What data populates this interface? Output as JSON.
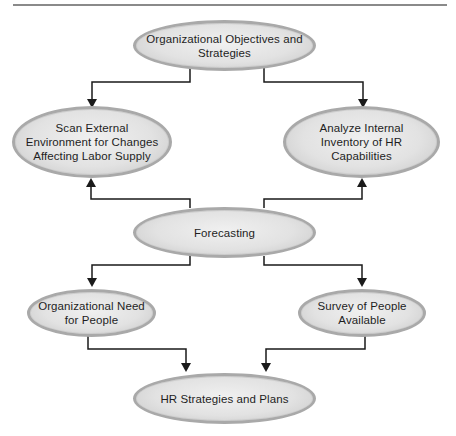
{
  "diagram": {
    "type": "flowchart",
    "nodes": {
      "objectives": {
        "label": "Organizational Objectives and Strategies",
        "lines": [
          "Organizational Objectives and",
          "Strategies"
        ]
      },
      "scan_external": {
        "label": "Scan External Environment for Changes Affecting Labor Supply",
        "lines": [
          "Scan External",
          "Environment for Changes",
          "Affecting Labor Supply"
        ]
      },
      "analyze_internal": {
        "label": "Analyze Internal Inventory of HR Capabilities",
        "lines": [
          "Analyze Internal",
          "Inventory of HR",
          "Capabilities"
        ]
      },
      "forecasting": {
        "label": "Forecasting",
        "lines": [
          "Forecasting"
        ]
      },
      "org_need": {
        "label": "Organizational Need for People",
        "lines": [
          "Organizational Need",
          "for People"
        ]
      },
      "survey_people": {
        "label": "Survey of People Available",
        "lines": [
          "Survey of People",
          "Available"
        ]
      },
      "hr_strategies": {
        "label": "HR Strategies and Plans",
        "lines": [
          "HR Strategies and Plans"
        ]
      }
    },
    "edges": [
      {
        "from": "objectives",
        "to": "scan_external"
      },
      {
        "from": "objectives",
        "to": "analyze_internal"
      },
      {
        "from": "forecasting",
        "to": "scan_external"
      },
      {
        "from": "forecasting",
        "to": "analyze_internal"
      },
      {
        "from": "forecasting",
        "to": "org_need"
      },
      {
        "from": "forecasting",
        "to": "survey_people"
      },
      {
        "from": "org_need",
        "to": "hr_strategies"
      },
      {
        "from": "survey_people",
        "to": "hr_strategies"
      }
    ],
    "colors": {
      "node_fill": "#e2e2e2",
      "node_border": "#a9a9a9",
      "connector": "#1a1a1a",
      "divider": "#8a8a8a"
    }
  }
}
